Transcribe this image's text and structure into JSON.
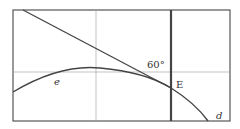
{
  "diagram": {
    "labels": {
      "angle": "60°",
      "point_e_upper": "E",
      "curve_e": "e",
      "curve_d": "d"
    },
    "colors": {
      "frame": "#555555",
      "grid": "#aaaaaa",
      "line": "#444444",
      "background": "#ffffff"
    }
  }
}
